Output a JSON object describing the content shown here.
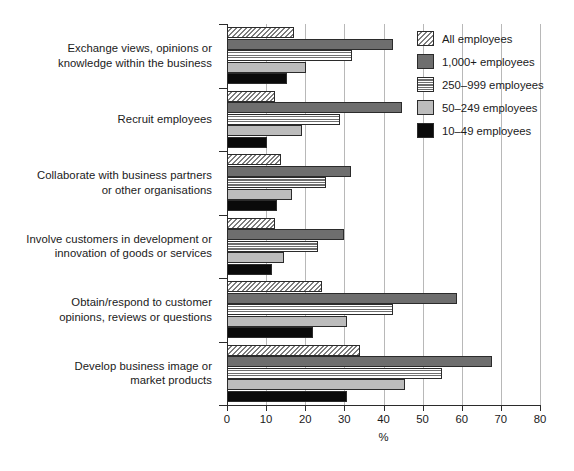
{
  "chart_data": {
    "type": "bar",
    "orientation": "horizontal",
    "title": "",
    "xlabel": "%",
    "ylabel": "",
    "xlim": [
      0,
      80
    ],
    "xticks": [
      0,
      10,
      20,
      30,
      40,
      50,
      60,
      70,
      80
    ],
    "xticklabels": [
      "0",
      "10",
      "20",
      "30",
      "40",
      "50",
      "60",
      "70",
      "80"
    ],
    "grid": "vertical",
    "legend_position": "top-right",
    "categories": [
      "Exchange views, opinions or knowledge within the business",
      "Recruit employees",
      "Collaborate with business partners or other organisations",
      "Involve customers in development or innovation of goods or services",
      "Obtain/respond to customer opinions, reviews or questions",
      "Develop business image or market products"
    ],
    "category_lines": [
      [
        "Exchange views, opinions or",
        "knowledge within the business"
      ],
      [
        "Recruit employees"
      ],
      [
        "Collaborate with business partners",
        "or other organisations"
      ],
      [
        "Involve customers in development or",
        "innovation of goods or services"
      ],
      [
        "Obtain/respond to customer",
        "opinions, reviews or questions"
      ],
      [
        "Develop business image or",
        "market products"
      ]
    ],
    "series": [
      {
        "name": "All employees",
        "fill": "diagonal-hatch",
        "color": "#ffffff",
        "values": [
          17.0,
          12.3,
          13.8,
          12.3,
          24.3,
          34.0
        ]
      },
      {
        "name": "1,000+ employees",
        "fill": "solid-dark-gray",
        "color": "#6e6e6e",
        "values": [
          42.4,
          44.8,
          31.7,
          30.0,
          58.8,
          67.8
        ]
      },
      {
        "name": "250–999 employees",
        "fill": "horizontal-lines",
        "color": "#ffffff",
        "values": [
          32.0,
          28.9,
          25.3,
          23.3,
          42.4,
          55.0
        ]
      },
      {
        "name": "50–249 employees",
        "fill": "solid-light-gray",
        "color": "#bcbcbc",
        "values": [
          20.2,
          19.2,
          16.6,
          14.6,
          30.7,
          45.5
        ]
      },
      {
        "name": "10–49 employees",
        "fill": "solid-black",
        "color": "#0a0a0a",
        "values": [
          15.3,
          10.2,
          12.8,
          11.4,
          22.0,
          30.7
        ]
      }
    ]
  },
  "legend": {
    "items": [
      {
        "label": "All employees"
      },
      {
        "label": "1,000+ employees"
      },
      {
        "label": "250–999 employees"
      },
      {
        "label": "50–249 employees"
      },
      {
        "label": "10–49 employees"
      }
    ]
  }
}
